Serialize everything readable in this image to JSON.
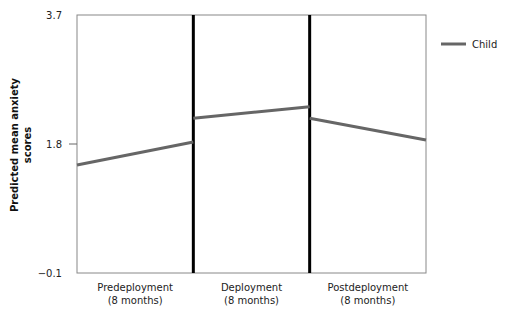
{
  "chart_data": {
    "type": "line",
    "title": "",
    "ylabel_lines": [
      "Predicted mean anxiety",
      "scores"
    ],
    "xlabel": "",
    "ylim": [
      -0.1,
      3.7
    ],
    "yticks": [
      -0.1,
      1.8,
      3.7
    ],
    "ytick_labels": [
      "−0.1",
      "1.8",
      "3.7"
    ],
    "grid": false,
    "legend": {
      "position": "top-right",
      "entries": [
        "Child"
      ]
    },
    "panels": [
      {
        "label_lines": [
          "Predeployment",
          "(8 months)"
        ],
        "start": 1.49,
        "end": 1.83
      },
      {
        "label_lines": [
          "Deployment",
          "(8 months)"
        ],
        "start": 2.18,
        "end": 2.35
      },
      {
        "label_lines": [
          "Postdeployment",
          "(8 months)"
        ],
        "start": 2.18,
        "end": 1.86
      }
    ],
    "series": [
      {
        "name": "Child",
        "color": "#666666",
        "segments": [
          [
            1.49,
            1.83
          ],
          [
            2.18,
            2.35
          ],
          [
            2.18,
            1.86
          ]
        ]
      }
    ]
  }
}
